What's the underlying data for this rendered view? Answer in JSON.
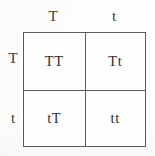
{
  "figure": {
    "type": "punnett-square",
    "border_color": "#5a5a5c",
    "text_color": "#2e2e2e",
    "background_color": "#fdfdfc"
  },
  "top_alleles": [
    {
      "label": "T"
    },
    {
      "label": "t"
    }
  ],
  "side_alleles": [
    {
      "label": "T"
    },
    {
      "label": "t"
    }
  ],
  "cells": [
    {
      "row": 0,
      "col": 0,
      "genotype": "TT"
    },
    {
      "row": 0,
      "col": 1,
      "genotype": "Tt"
    },
    {
      "row": 1,
      "col": 0,
      "genotype": "tT"
    },
    {
      "row": 1,
      "col": 1,
      "genotype": "tt"
    }
  ]
}
